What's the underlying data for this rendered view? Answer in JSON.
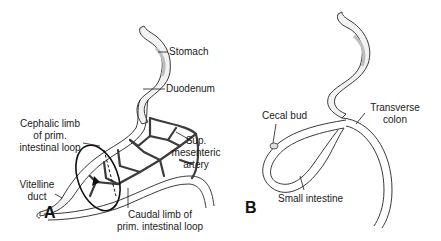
{
  "figure": {
    "panels": [
      {
        "id": "A",
        "letter": "A",
        "labels": {
          "stomach": "Stomach",
          "duodenum": "Duodenum",
          "cephalic_line1": "Cephalic limb",
          "cephalic_line2": "of prim.",
          "cephalic_line3": "intestinal loop",
          "sma_line1": "Sup.",
          "sma_line2": "mesenteric",
          "sma_line3": "artery",
          "vitelline_line1": "Vitelline",
          "vitelline_line2": "duct",
          "caudal_line1": "Caudal limb of",
          "caudal_line2": "prim. intestinal loop"
        }
      },
      {
        "id": "B",
        "letter": "B",
        "labels": {
          "cecal_bud": "Cecal bud",
          "transverse_line1": "Transverse",
          "transverse_line2": "colon",
          "small_intestine": "Small intestine"
        }
      }
    ],
    "colors": {
      "outline": "#3a3a3a",
      "fill": "#f2f2f2",
      "shade": "#cfcfcf",
      "vessel": "#3c3c3c"
    }
  }
}
